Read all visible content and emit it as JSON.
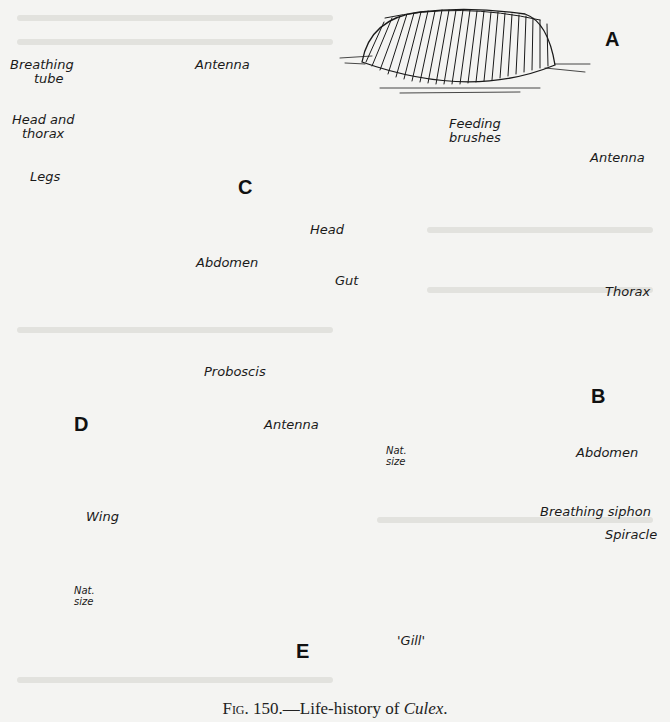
{
  "figure": {
    "caption_prefix": "Fig. 150.",
    "caption_dash": "—Life-history of ",
    "caption_genus": "Culex",
    "caption_end": "."
  },
  "panels": {
    "A": {
      "letter": "A",
      "subject": "egg raft"
    },
    "B": {
      "letter": "B",
      "subject": "larva",
      "labels": {
        "feeding_brushes_1": "Feeding",
        "feeding_brushes_2": "brushes",
        "antenna": "Antenna",
        "head": "Head",
        "gut": "Gut",
        "thorax": "Thorax",
        "abdomen": "Abdomen",
        "breathing_siphon": "Breathing siphon",
        "spiracle": "Spiracle",
        "gill": "'Gill'"
      },
      "scale_1": "Nat.",
      "scale_2": "size"
    },
    "C": {
      "letter": "C",
      "subject": "pupa",
      "labels": {
        "breathing_tube_1": "Breathing",
        "breathing_tube_2": "tube",
        "antenna": "Antenna",
        "head_thorax_1": "Head and",
        "head_thorax_2": "thorax",
        "legs": "Legs",
        "abdomen": "Abdomen"
      }
    },
    "D": {
      "letter": "D",
      "subject": "adult",
      "labels": {
        "proboscis": "Proboscis",
        "antenna": "Antenna",
        "wing": "Wing"
      },
      "scale_1": "Nat.",
      "scale_2": "size"
    },
    "E": {
      "letter": "E",
      "subject": "male antenna detail"
    }
  }
}
